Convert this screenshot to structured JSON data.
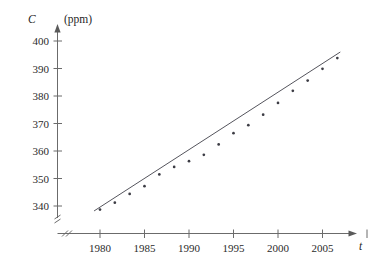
{
  "chart_data": {
    "type": "scatter",
    "title": "",
    "subtitle": "",
    "xlabel": "t",
    "ylabel": "C",
    "yunit": "(ppm)",
    "xlim": [
      1978.5,
      2012.5
    ],
    "ylim": [
      336,
      402
    ],
    "grid": false,
    "legend": "none",
    "x_ticks": [
      1980,
      1985,
      1990,
      1995,
      2000,
      2005,
      2010
    ],
    "x_tick_labels": [
      "1980",
      "1985",
      "1990",
      "1995",
      "2000",
      "2005",
      "2010"
    ],
    "y_ticks": [
      340,
      350,
      360,
      370,
      380,
      390,
      400
    ],
    "y_tick_labels": [
      "340",
      "350",
      "360",
      "370",
      "380",
      "390",
      "400"
    ],
    "axis_break_x": true,
    "axis_break_y": true,
    "x": [
      1980,
      1982,
      1984,
      1986,
      1988,
      1990,
      1992,
      1994,
      1996,
      1998,
      2000,
      2002,
      2004,
      2006,
      2008,
      2010,
      2012
    ],
    "values": [
      338.7,
      341.2,
      344.4,
      347.2,
      351.5,
      354.2,
      356.3,
      358.6,
      362.4,
      366.5,
      369.4,
      373.2,
      377.5,
      381.9,
      385.6,
      389.9,
      393.8
    ],
    "series": [
      {
        "name": "CO2 concentration",
        "marker": "point",
        "values": [
          338.7,
          341.2,
          344.4,
          347.2,
          351.5,
          354.2,
          356.3,
          358.6,
          362.4,
          366.5,
          369.4,
          373.2,
          377.5,
          381.9,
          385.6,
          389.9,
          393.8
        ]
      }
    ],
    "fit_line": {
      "name": "linear regression",
      "x_start": 1979.2,
      "y_start": 338.2,
      "x_end": 2012.4,
      "y_end": 396.0
    },
    "annotations": []
  },
  "axes": {
    "y_axis_name": "C",
    "y_axis_unit": "(ppm)",
    "x_axis_name": "t"
  }
}
